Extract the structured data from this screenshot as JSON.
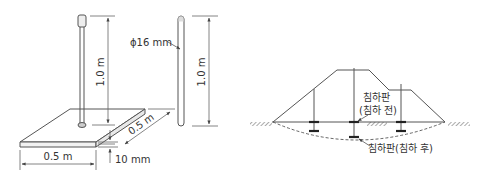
{
  "left_diagram": {
    "title": "settlement plate dimensions",
    "rod_height_label": "1.0 m",
    "rod_height_label_right": "1.0 m",
    "rod_diameter_label": "ϕ16 mm",
    "plate_width_label": "0.5 m",
    "plate_depth_label": "0.5 m",
    "plate_thickness_label": "10 mm"
  },
  "right_diagram": {
    "title": "embankment settlement cross-section",
    "before_label_line1": "침하판",
    "before_label_line2": "(침하 전)",
    "after_label": "침하판(침하 후)"
  },
  "colors": {
    "line": "#555555",
    "dim": "#666666",
    "text": "#333333"
  }
}
